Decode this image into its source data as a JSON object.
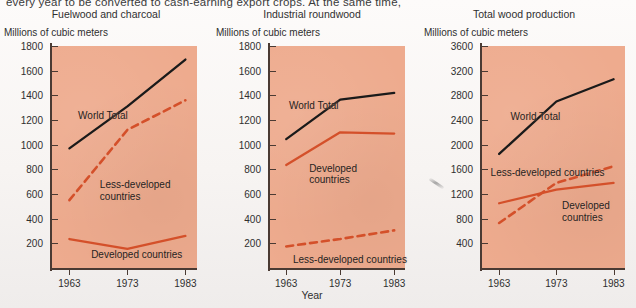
{
  "caption": {
    "top_text": "every year to be converted to cash-earning export crops. At the same time,"
  },
  "axis": {
    "x_title": "Year",
    "y_unit": "Millions of cubic meters",
    "x_tick_labels": [
      "1963",
      "1973",
      "1983"
    ]
  },
  "series_labels": {
    "world": "World Total",
    "less_developed": "Less-developed countries",
    "less_developed_l1": "Less-developed",
    "less_developed_l2": "countries",
    "developed": "Developed countries",
    "developed_l1": "Developed",
    "developed_l2": "countries"
  },
  "colors": {
    "plot_background": "#eeab8e",
    "page_background": "#fbf9f7",
    "world_total_line": "#1a1a1a",
    "developed_line": "#d4502a",
    "less_developed_line": "#d4502a",
    "axis": "#4a3a33",
    "text": "#2f2f2f"
  },
  "chart_data": [
    {
      "type": "line",
      "title": "Fuelwood and charcoal",
      "xlabel": "Year",
      "ylabel": "Millions of cubic meters",
      "x": [
        1963,
        1973,
        1983
      ],
      "xlim": [
        1960,
        1985
      ],
      "ylim": [
        0,
        1800
      ],
      "ytick_labels": [
        "200",
        "400",
        "600",
        "800",
        "1000",
        "1200",
        "1400",
        "1600",
        "1800"
      ],
      "yticks": [
        200,
        400,
        600,
        800,
        1000,
        1200,
        1400,
        1600,
        1800
      ],
      "grid": false,
      "legend": "inline-annotations",
      "series": [
        {
          "name": "World Total",
          "values": [
            970,
            1310,
            1690
          ],
          "style": "solid",
          "color": "#1a1a1a"
        },
        {
          "name": "Less-developed countries",
          "values": [
            550,
            1120,
            1360
          ],
          "style": "dashed",
          "color": "#d4502a"
        },
        {
          "name": "Developed countries",
          "values": [
            235,
            155,
            260
          ],
          "style": "solid",
          "color": "#d4502a"
        }
      ]
    },
    {
      "type": "line",
      "title": "Industrial roundwood",
      "xlabel": "Year",
      "ylabel": "Millions of cubic meters",
      "x": [
        1963,
        1973,
        1983
      ],
      "xlim": [
        1960,
        1985
      ],
      "ylim": [
        0,
        1800
      ],
      "ytick_labels": [
        "200",
        "400",
        "600",
        "800",
        "1000",
        "1200",
        "1400",
        "1600",
        "1800"
      ],
      "yticks": [
        200,
        400,
        600,
        800,
        1000,
        1200,
        1400,
        1600,
        1800
      ],
      "grid": false,
      "legend": "inline-annotations",
      "series": [
        {
          "name": "World Total",
          "values": [
            1045,
            1365,
            1420
          ],
          "style": "solid",
          "color": "#1a1a1a"
        },
        {
          "name": "Developed countries",
          "values": [
            835,
            1100,
            1090
          ],
          "style": "solid",
          "color": "#d4502a"
        },
        {
          "name": "Less-developed countries",
          "values": [
            175,
            235,
            305
          ],
          "style": "dashed",
          "color": "#d4502a"
        }
      ]
    },
    {
      "type": "line",
      "title": "Total wood production",
      "xlabel": "Year",
      "ylabel": "Millions of cubic meters",
      "x": [
        1963,
        1973,
        1983
      ],
      "xlim": [
        1960,
        1985
      ],
      "ylim": [
        0,
        3600
      ],
      "ytick_labels": [
        "400",
        "800",
        "1200",
        "1600",
        "2000",
        "2400",
        "2800",
        "3200",
        "3600"
      ],
      "yticks": [
        400,
        800,
        1200,
        1600,
        2000,
        2400,
        2800,
        3200,
        3600
      ],
      "grid": false,
      "legend": "inline-annotations",
      "series": [
        {
          "name": "World Total",
          "values": [
            1850,
            2700,
            3060
          ],
          "style": "solid",
          "color": "#1a1a1a"
        },
        {
          "name": "Less-developed countries",
          "values": [
            730,
            1380,
            1650
          ],
          "style": "dashed",
          "color": "#d4502a"
        },
        {
          "name": "Developed countries",
          "values": [
            1050,
            1270,
            1380
          ],
          "style": "solid",
          "color": "#d4502a"
        }
      ]
    }
  ],
  "annotations": [
    {
      "panel": 0,
      "series": "World Total",
      "text": "World Total",
      "x_frac": 0.18,
      "y_frac": 0.29,
      "lines": 1
    },
    {
      "panel": 0,
      "series": "Less-developed countries",
      "text": "Less-developed\ncountries",
      "x_frac": 0.33,
      "y_frac": 0.6,
      "lines": 2
    },
    {
      "panel": 0,
      "series": "Developed countries",
      "text": "Developed countries",
      "x_frac": 0.27,
      "y_frac": 0.915,
      "lines": 1
    },
    {
      "panel": 1,
      "series": "World Total",
      "text": "World Total",
      "x_frac": 0.14,
      "y_frac": 0.245,
      "lines": 1
    },
    {
      "panel": 1,
      "series": "Developed countries",
      "text": "Developed\ncountries",
      "x_frac": 0.29,
      "y_frac": 0.525,
      "lines": 2
    },
    {
      "panel": 1,
      "series": "Less-developed countries",
      "text": "Less-developed countries",
      "x_frac": 0.17,
      "y_frac": 0.935,
      "lines": 1
    },
    {
      "panel": 2,
      "series": "World Total",
      "text": "World Total",
      "x_frac": 0.2,
      "y_frac": 0.295,
      "lines": 1
    },
    {
      "panel": 2,
      "series": "Less-developed countries",
      "text": "Less-developed countries",
      "x_frac": 0.06,
      "y_frac": 0.545,
      "lines": 1
    },
    {
      "panel": 2,
      "series": "Developed countries",
      "text": "Developed\ncountries",
      "x_frac": 0.56,
      "y_frac": 0.695,
      "lines": 2
    }
  ],
  "artifact": {
    "name": "scan-smudge",
    "x": 428,
    "y": 182
  }
}
